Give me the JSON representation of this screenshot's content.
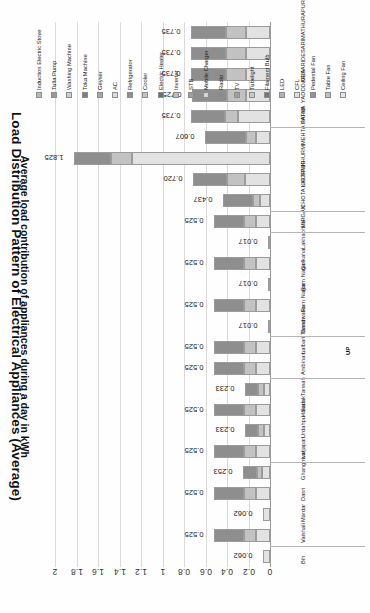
{
  "chart_data": {
    "type": "bar",
    "orientation": "stacked-horizontal-rotated",
    "title": "Load Distribution Pattern of Electrical Appliances (Average)",
    "xlabel": "",
    "ylabel": "Average load contribution of appliances during a day in kWh",
    "ylim": [
      0,
      2
    ],
    "ytick_labels": [
      "0",
      "0.2",
      "0.4",
      "0.6",
      "0.8",
      "1",
      "1.2",
      "1.4",
      "1.6",
      "1.8",
      "2"
    ],
    "ytick_values": [
      0,
      0.2,
      0.4,
      0.6,
      0.8,
      1,
      1.2,
      1.4,
      1.6,
      1.8,
      2
    ],
    "grid": true,
    "legend_position": "top",
    "series": [
      {
        "name": "Induction Electric Stove",
        "color": "#b9b9b9"
      },
      {
        "name": "Tulla Pump",
        "color": "#9a9a9a"
      },
      {
        "name": "Washing Machine",
        "color": "#cfcfcf"
      },
      {
        "name": "Toka Machine",
        "color": "#7f7f7f"
      },
      {
        "name": "Geyser",
        "color": "#a8a8a8"
      },
      {
        "name": "AC",
        "color": "#dcdcdc"
      },
      {
        "name": "Refrigerator",
        "color": "#8f8f8f"
      },
      {
        "name": "Cooler",
        "color": "#c4c4c4"
      },
      {
        "name": "Electric Heater",
        "color": "#6f6f6f"
      },
      {
        "name": "Inverter",
        "color": "#bdbdbd"
      },
      {
        "name": "STB",
        "color": "#a0a0a0"
      },
      {
        "name": "Mobile Charger",
        "color": "#d4d4d4"
      },
      {
        "name": "Radio",
        "color": "#8a8a8a"
      },
      {
        "name": "TV",
        "color": "#9e9e9e"
      },
      {
        "name": "Tubelight",
        "color": "#c9c9c9"
      },
      {
        "name": "Filament Bulb",
        "color": "#767676"
      },
      {
        "name": "LED",
        "color": "#b2b2b2"
      },
      {
        "name": "CFL",
        "color": "#e0e0e0"
      },
      {
        "name": "Pedestal Fan",
        "color": "#949494"
      },
      {
        "name": "Table Fan",
        "color": "#c0c0c0"
      },
      {
        "name": "Ceiling Fan",
        "color": "#e6e6e6"
      }
    ],
    "categories": [
      {
        "village": "MATHURAPUR",
        "state_group": "",
        "total": 0.735
      },
      {
        "village": "DESARI",
        "state_group": "",
        "total": 0.735
      },
      {
        "village": "DESARI",
        "state_group": "",
        "total": 0.735
      },
      {
        "village": "YADODARIA",
        "state_group": "",
        "total": 0.725
      },
      {
        "village": "PATNA",
        "state_group": "",
        "total": 0.735
      },
      {
        "village": "MEHTA SAHIB",
        "state_group": "",
        "total": 0.607
      },
      {
        "village": "KHURMI",
        "state_group": "",
        "total": 1.825
      },
      {
        "village": "KHURMI",
        "state_group": "",
        "total": 0.72
      },
      {
        "village": "CHOTA LIGTIPUR",
        "state_group": "",
        "total": 0.437
      },
      {
        "village": "MIRGAN",
        "state_group": "",
        "total": 0.525
      },
      {
        "village": "Lakhabhira",
        "state_group": "",
        "total": 0.017
      },
      {
        "village": "Golkaha",
        "state_group": "",
        "total": 0.525
      },
      {
        "village": "Ram Nagar",
        "state_group": "",
        "total": 0.017
      },
      {
        "village": "Ram Nagar",
        "state_group": "",
        "total": 0.525
      },
      {
        "village": "Bandwalia",
        "state_group": "",
        "total": 0.017
      },
      {
        "village": "Lalbari Tarwar",
        "state_group": "UP",
        "total": 0.525
      },
      {
        "village": "Ambinam",
        "state_group": "",
        "total": 0.525
      },
      {
        "village": "Tarwah",
        "state_group": "",
        "total": 0.233
      },
      {
        "village": "Hasan",
        "state_group": "",
        "total": 0.525
      },
      {
        "village": "Urdahpur Sadak",
        "state_group": "",
        "total": 0.233
      },
      {
        "village": "Larjapan",
        "state_group": "",
        "total": 0.525
      },
      {
        "village": "Ghanghwal",
        "state_group": "",
        "total": 0.253
      },
      {
        "village": "Dasri",
        "state_group": "",
        "total": 0.525
      },
      {
        "village": "Mardar",
        "state_group": "",
        "total": 0.062
      },
      {
        "village": "Vaishali",
        "state_group": "",
        "total": 0.525
      },
      {
        "village": "Bih",
        "state_group": "",
        "total": 0.062
      }
    ],
    "stack_values": [
      [
        0.735,
        [
          0.22,
          0.19,
          0.325
        ]
      ],
      [
        0.735,
        [
          0.22,
          0.19,
          0.325
        ]
      ],
      [
        0.735,
        [
          0.22,
          0.19,
          0.325
        ]
      ],
      [
        0.725,
        [
          0.22,
          0.18,
          0.325
        ]
      ],
      [
        0.735,
        [
          0.3,
          0.12,
          0.315
        ]
      ],
      [
        0.607,
        [
          0.13,
          0.09,
          0.387
        ]
      ],
      [
        1.825,
        [
          1.28,
          0.2,
          0.345
        ]
      ],
      [
        0.72,
        [
          0.23,
          0.17,
          0.32
        ]
      ],
      [
        0.437,
        [
          0.09,
          0.07,
          0.277
        ]
      ],
      [
        0.525,
        [
          0.13,
          0.11,
          0.285
        ]
      ],
      [
        0.017,
        [
          0.017,
          0,
          0
        ]
      ],
      [
        0.525,
        [
          0.13,
          0.11,
          0.285
        ]
      ],
      [
        0.017,
        [
          0.017,
          0,
          0
        ]
      ],
      [
        0.525,
        [
          0.13,
          0.11,
          0.285
        ]
      ],
      [
        0.017,
        [
          0.017,
          0,
          0
        ]
      ],
      [
        0.525,
        [
          0.13,
          0.11,
          0.285
        ]
      ],
      [
        0.525,
        [
          0.13,
          0.11,
          0.285
        ]
      ],
      [
        0.233,
        [
          0.06,
          0.05,
          0.123
        ]
      ],
      [
        0.525,
        [
          0.13,
          0.11,
          0.285
        ]
      ],
      [
        0.233,
        [
          0.06,
          0.05,
          0.123
        ]
      ],
      [
        0.525,
        [
          0.13,
          0.11,
          0.285
        ]
      ],
      [
        0.253,
        [
          0.07,
          0.05,
          0.133
        ]
      ],
      [
        0.525,
        [
          0.13,
          0.11,
          0.285
        ]
      ],
      [
        0.062,
        [
          0.062,
          0,
          0
        ]
      ],
      [
        0.525,
        [
          0.13,
          0.11,
          0.285
        ]
      ],
      [
        0.062,
        [
          0.062,
          0,
          0
        ]
      ]
    ]
  },
  "legend": {
    "items": [
      "Induction Electric Stove",
      "Tulla Pump",
      "Washing Machine",
      "Toka Machine",
      "Geyser",
      "AC",
      "Refrigerator",
      "Cooler",
      "Electric Heater",
      "Inverter",
      "STB",
      "Mobile Charger",
      "Radio",
      "TV",
      "Tubelight",
      "Filament Bulb",
      "LED",
      "CFL",
      "Pedestal Fan",
      "Table Fan",
      "Ceiling Fan"
    ]
  }
}
